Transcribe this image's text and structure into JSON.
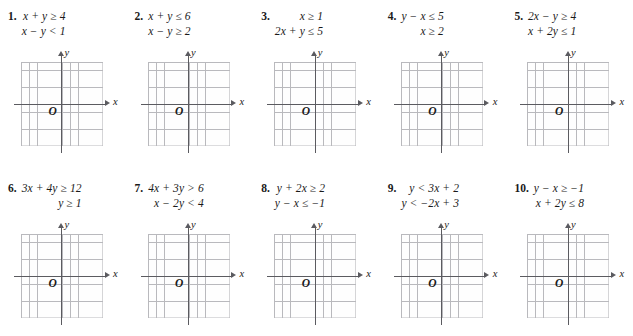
{
  "exercise_set": {
    "layout": {
      "rows": 2,
      "columns": 5,
      "total_problems": 10
    },
    "problems": [
      {
        "number": "1.",
        "inequalities": [
          "x + y ≥ 4",
          "x − y < 1"
        ]
      },
      {
        "number": "2.",
        "inequalities": [
          "x + y ≤ 6",
          "x − y ≥ 2"
        ]
      },
      {
        "number": "3.",
        "inequalities": [
          "x ≥ 1",
          "2x + y ≤ 5"
        ]
      },
      {
        "number": "4.",
        "inequalities": [
          "y − x ≤ 5",
          "x ≥ 2"
        ]
      },
      {
        "number": "5.",
        "inequalities": [
          "2x − y ≥ 4",
          "x + 2y ≤ 1"
        ]
      },
      {
        "number": "6.",
        "inequalities": [
          "3x + 4y ≥ 12",
          "y ≥ 1"
        ]
      },
      {
        "number": "7.",
        "inequalities": [
          "4x + 3y > 6",
          "x − 2y < 4"
        ]
      },
      {
        "number": "8.",
        "inequalities": [
          "y + 2x ≥ 2",
          "y − x ≤ −1"
        ]
      },
      {
        "number": "9.",
        "inequalities": [
          "y < 3x + 2",
          "y < −2x + 3"
        ]
      },
      {
        "number": "10.",
        "inequalities": [
          "y − x ≥ −1",
          "x + 2y ≤ 8"
        ]
      }
    ]
  },
  "graph": {
    "x_axis_label": "x",
    "y_axis_label": "y",
    "origin_label": "O",
    "grid_columns": 10,
    "grid_rows": 10,
    "grid_line_color": "#b9b9bd",
    "axis_color": "#5b5b60",
    "background_color": "#ffffff"
  },
  "chart_data": {
    "type": "scatter",
    "title": "",
    "xlabel": "x",
    "ylabel": "y",
    "grid": true,
    "legend": "none",
    "xlim": [
      -5,
      5
    ],
    "ylim": [
      -5,
      5
    ],
    "x": [],
    "y": [],
    "note": "Ten blank 10-by-10 coordinate grids provided for graphing the systems of linear inequalities listed above each grid. No data plotted."
  }
}
